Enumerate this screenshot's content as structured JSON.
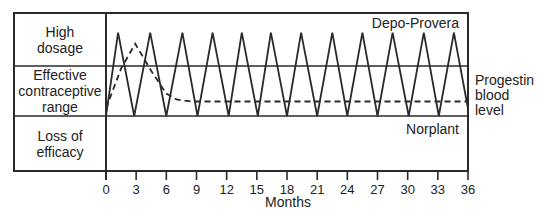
{
  "chart_data": {
    "type": "line",
    "title": "",
    "xlabel": "Months",
    "ylabel": "Progestin blood level",
    "xlim": [
      0,
      36
    ],
    "x_ticks": [
      0,
      3,
      6,
      9,
      12,
      15,
      18,
      21,
      24,
      27,
      30,
      33,
      36
    ],
    "y_bands": [
      {
        "label_lines": [
          "High",
          "dosage"
        ],
        "range": [
          2,
          3
        ]
      },
      {
        "label_lines": [
          "Effective",
          "contraceptive",
          "range"
        ],
        "range": [
          1,
          2
        ]
      },
      {
        "label_lines": [
          "Loss of",
          "efficacy"
        ],
        "range": [
          0,
          1
        ]
      }
    ],
    "ylim": [
      0,
      3
    ],
    "grid": "horizontal band dividers",
    "series": [
      {
        "name": "Depo-Provera",
        "style": "solid",
        "x": [
          0,
          1.2,
          2.8,
          4.4,
          6.0,
          7.6,
          9.1,
          10.6,
          12.2,
          13.5,
          15.1,
          16.4,
          18.0,
          19.4,
          21.0,
          22.5,
          24.0,
          25.5,
          27.0,
          28.5,
          30.1,
          31.6,
          33.1,
          34.6,
          36.0
        ],
        "y": [
          1.0,
          2.63,
          1.0,
          2.63,
          1.0,
          2.63,
          1.0,
          2.63,
          1.0,
          2.63,
          1.0,
          2.63,
          1.0,
          2.63,
          1.0,
          2.63,
          1.0,
          2.63,
          1.0,
          2.63,
          1.0,
          2.63,
          1.0,
          2.63,
          1.15
        ]
      },
      {
        "name": "Norplant",
        "style": "dashed",
        "x": [
          0,
          1.5,
          2.9,
          4.5,
          6.0,
          7.0,
          8.5,
          10,
          36
        ],
        "y": [
          1.15,
          1.95,
          2.42,
          1.9,
          1.45,
          1.33,
          1.29,
          1.29,
          1.29
        ]
      }
    ],
    "annotations": [
      {
        "text": "Depo-Provera",
        "position": "top right inside plot"
      },
      {
        "text": "Norplant",
        "position": "right, below effective range line"
      },
      {
        "text": "Progestin blood level",
        "position": "right of plot, outside"
      }
    ],
    "legend": "none (inline labels)"
  },
  "labels": {
    "band_high": [
      "High",
      "dosage"
    ],
    "band_effective": [
      "Effective",
      "contraceptive",
      "range"
    ],
    "band_loss": [
      "Loss of",
      "efficacy"
    ],
    "depo": "Depo-Provera",
    "norplant": "Norplant",
    "ylabel_lines": [
      "Progestin",
      "blood",
      "level"
    ],
    "xlabel": "Months"
  }
}
